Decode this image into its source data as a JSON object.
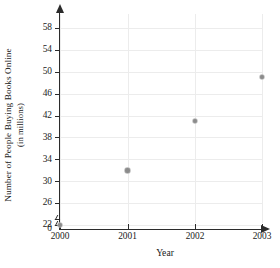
{
  "chart_data": {
    "type": "scatter",
    "title": "",
    "xlabel": "Year",
    "ylabel": "Number of People Buying Books Online (in millions)",
    "ylabel_line1": "Number of People Buying Books Online",
    "ylabel_line2": "(in millions)",
    "x": [
      2000,
      2001,
      2002,
      2003
    ],
    "values": [
      22,
      32,
      41,
      49
    ],
    "categories": [
      "2000",
      "2001",
      "2002",
      "2003"
    ],
    "series": [
      {
        "name": "People Buying Books Online",
        "points": [
          {
            "x": "2000",
            "y": 22
          },
          {
            "x": "2001",
            "y": 32
          },
          {
            "x": "2002",
            "y": 41
          },
          {
            "x": "2003",
            "y": 49
          }
        ]
      }
    ],
    "xtick_labels": [
      "2000",
      "2001",
      "2002",
      "2003"
    ],
    "ytick_labels": [
      "0",
      "22",
      "26",
      "30",
      "34",
      "38",
      "42",
      "46",
      "50",
      "54",
      "58"
    ],
    "ylim": [
      22,
      60
    ],
    "xlim": [
      2000,
      2003
    ],
    "y_axis_break": true,
    "y_axis_break_between": [
      0,
      22
    ],
    "grid": true,
    "legend": "none",
    "marker_color": "#8b8b8b",
    "axis_color": "#2b2b2b",
    "grid_color": "#ececec"
  }
}
